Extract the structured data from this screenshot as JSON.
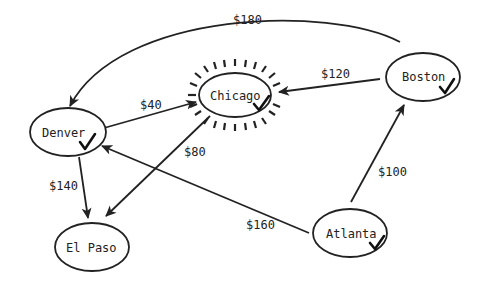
{
  "diagram": {
    "type": "directed-graph",
    "colors": {
      "ink": "#222222",
      "background": "#ffffff"
    },
    "nodes": [
      {
        "id": "denver",
        "label": "Denver",
        "visited": true
      },
      {
        "id": "chicago",
        "label": "Chicago",
        "visited": true,
        "highlighted": true
      },
      {
        "id": "boston",
        "label": "Boston",
        "visited": true
      },
      {
        "id": "el_paso",
        "label": "El Paso",
        "visited": false
      },
      {
        "id": "atlanta",
        "label": "Atlanta",
        "visited": true
      }
    ],
    "edges": [
      {
        "from": "boston",
        "to": "denver",
        "label": "$180"
      },
      {
        "from": "boston",
        "to": "chicago",
        "label": "$120"
      },
      {
        "from": "denver",
        "to": "chicago",
        "label": "$40"
      },
      {
        "from": "chicago",
        "to": "el_paso",
        "label": "$80"
      },
      {
        "from": "denver",
        "to": "el_paso",
        "label": "$140"
      },
      {
        "from": "atlanta",
        "to": "boston",
        "label": "$100"
      },
      {
        "from": "atlanta",
        "to": "denver",
        "label": "$160"
      }
    ]
  }
}
